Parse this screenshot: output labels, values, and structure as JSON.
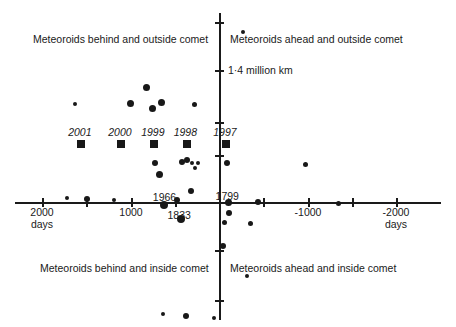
{
  "chart_data": {
    "type": "scatter",
    "title": "",
    "xlabel": "days",
    "ylabel": "",
    "xlim": [
      2400,
      -2400
    ],
    "ylim": [
      -1.0,
      2.6
    ],
    "grid": false,
    "legend_position": "none",
    "x_axis": {
      "unit_label_left": "days",
      "unit_label_right": "days",
      "tick_labels": [
        "2000",
        "1000",
        "-1000",
        "-2000"
      ],
      "tick_values": [
        2000,
        1000,
        -1000,
        -2000
      ],
      "minor_tick_values": [
        1500,
        500,
        -500,
        -1500
      ],
      "direction_note": "x decreases to the right"
    },
    "y_axis": {
      "tick_count": 5,
      "annotation": "1·4 million km",
      "annotation_value": 1.4
    },
    "quadrant_labels": {
      "top_left": "Meteoroids behind and outside comet",
      "top_right": "Meteoroids ahead and outside comet",
      "bottom_left": "Meteoroids behind and inside comet",
      "bottom_right": "Meteoroids ahead and inside comet"
    },
    "encounter_years": [
      {
        "label": "2001",
        "x": 1560,
        "y": 0.62
      },
      {
        "label": "2000",
        "x": 1110,
        "y": 0.62
      },
      {
        "label": "1999",
        "x": 740,
        "y": 0.62
      },
      {
        "label": "1998",
        "x": 375,
        "y": 0.62
      },
      {
        "label": "1997",
        "x": -70,
        "y": 0.62
      }
    ],
    "storm_labels": [
      {
        "label": "1966",
        "x": 620,
        "y": 0.05
      },
      {
        "label": "1833",
        "x": 455,
        "y": -0.14
      },
      {
        "label": "1799",
        "x": -85,
        "y": 0.06
      }
    ],
    "series": [
      {
        "name": "Dust trail encounters",
        "marker": "circle",
        "color": "#181818",
        "points": [
          {
            "x": -255,
            "y": 1.82,
            "size": 4
          },
          {
            "x": 1630,
            "y": 1.05,
            "size": 4
          },
          {
            "x": 830,
            "y": 1.22,
            "size": 7
          },
          {
            "x": 1005,
            "y": 1.05,
            "size": 7
          },
          {
            "x": 755,
            "y": 1.0,
            "size": 7
          },
          {
            "x": 655,
            "y": 1.06,
            "size": 7
          },
          {
            "x": 290,
            "y": 1.04,
            "size": 5
          },
          {
            "x": 730,
            "y": 0.42,
            "size": 6
          },
          {
            "x": 680,
            "y": 0.29,
            "size": 7
          },
          {
            "x": 430,
            "y": 0.43,
            "size": 6
          },
          {
            "x": 375,
            "y": 0.45,
            "size": 6
          },
          {
            "x": 310,
            "y": 0.42,
            "size": 4
          },
          {
            "x": 285,
            "y": 0.36,
            "size": 4
          },
          {
            "x": 250,
            "y": 0.42,
            "size": 4
          },
          {
            "x": -75,
            "y": 0.42,
            "size": 6
          },
          {
            "x": 1720,
            "y": 0.04,
            "size": 4
          },
          {
            "x": 1490,
            "y": 0.03,
            "size": 6
          },
          {
            "x": 1190,
            "y": 0.02,
            "size": 4
          },
          {
            "x": 625,
            "y": -0.03,
            "size": 8
          },
          {
            "x": 440,
            "y": -0.18,
            "size": 8
          },
          {
            "x": 480,
            "y": 0.02,
            "size": 6
          },
          {
            "x": 325,
            "y": 0.12,
            "size": 6
          },
          {
            "x": -90,
            "y": 0.0,
            "size": 7
          },
          {
            "x": -105,
            "y": -0.12,
            "size": 6
          },
          {
            "x": -55,
            "y": -0.22,
            "size": 5
          },
          {
            "x": -340,
            "y": -0.23,
            "size": 5
          },
          {
            "x": -430,
            "y": 0.0,
            "size": 6
          },
          {
            "x": -965,
            "y": 0.4,
            "size": 5
          },
          {
            "x": -1330,
            "y": -0.02,
            "size": 5
          },
          {
            "x": -35,
            "y": -0.47,
            "size": 6
          },
          {
            "x": -300,
            "y": -0.79,
            "size": 4
          },
          {
            "x": 640,
            "y": -1.2,
            "size": 4
          },
          {
            "x": 385,
            "y": -1.22,
            "size": 6
          },
          {
            "x": 65,
            "y": -1.24,
            "size": 4
          }
        ]
      }
    ]
  }
}
